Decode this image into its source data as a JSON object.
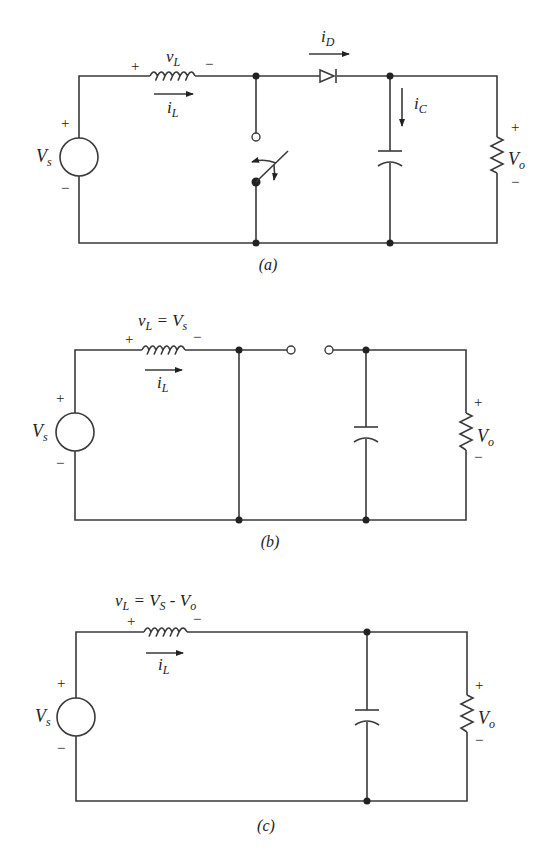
{
  "figure": {
    "panels": [
      {
        "id": "a",
        "caption": "(a)",
        "labels": {
          "source": "V",
          "source_sub": "s",
          "source_plus": "+",
          "source_minus": "−",
          "inductor_voltage": "v",
          "inductor_voltage_sub": "L",
          "inductor_plus": "+",
          "inductor_minus": "−",
          "inductor_current": "i",
          "inductor_current_sub": "L",
          "diode_current": "i",
          "diode_current_sub": "D",
          "cap_current": "i",
          "cap_current_sub": "C",
          "output": "V",
          "output_sub": "o",
          "output_plus": "+",
          "output_minus": "−"
        },
        "components": [
          "voltage-source",
          "inductor",
          "switch",
          "diode",
          "capacitor",
          "resistor"
        ]
      },
      {
        "id": "b",
        "caption": "(b)",
        "labels": {
          "inductor_voltage_eq": "v",
          "inductor_voltage_eq_sub": "L",
          "inductor_voltage_eq_rhs": " = V",
          "inductor_voltage_eq_rhs_sub": "s",
          "source": "V",
          "source_sub": "s",
          "source_plus": "+",
          "source_minus": "−",
          "inductor_plus": "+",
          "inductor_minus": "−",
          "inductor_current": "i",
          "inductor_current_sub": "L",
          "output": "V",
          "output_sub": "o",
          "output_plus": "+",
          "output_minus": "−"
        },
        "components": [
          "voltage-source",
          "inductor",
          "short-circuit",
          "open-diode",
          "capacitor",
          "resistor"
        ]
      },
      {
        "id": "c",
        "caption": "(c)",
        "labels": {
          "inductor_voltage_eq": "v",
          "inductor_voltage_eq_sub": "L",
          "inductor_voltage_eq_mid": " = V",
          "inductor_voltage_eq_mid_sub": "S",
          "inductor_voltage_eq_end": " -  V",
          "inductor_voltage_eq_end_sub": "o",
          "source": "V",
          "source_sub": "s",
          "source_plus": "+",
          "source_minus": "−",
          "inductor_plus": "+",
          "inductor_minus": "−",
          "inductor_current": "i",
          "inductor_current_sub": "L",
          "output": "V",
          "output_sub": "o",
          "output_plus": "+",
          "output_minus": "−"
        },
        "components": [
          "voltage-source",
          "inductor",
          "capacitor",
          "resistor"
        ]
      }
    ]
  }
}
